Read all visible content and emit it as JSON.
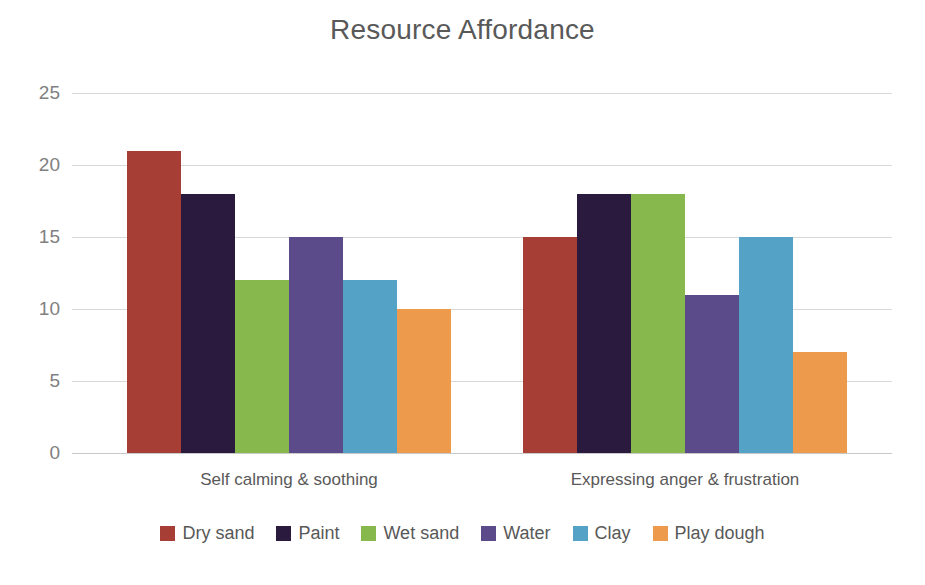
{
  "chart_data": {
    "type": "bar",
    "title": "Resource Affordance",
    "xlabel": "",
    "ylabel": "",
    "ylim": [
      0,
      25
    ],
    "yticks": [
      0,
      5,
      10,
      15,
      20,
      25
    ],
    "grid": true,
    "legend_position": "bottom",
    "categories": [
      "Self calming & soothing",
      "Expressing anger & frustration"
    ],
    "series": [
      {
        "name": "Dry sand",
        "color": "#A63E35",
        "values": [
          21,
          15
        ]
      },
      {
        "name": "Paint",
        "color": "#2A1A3E",
        "values": [
          18,
          18
        ]
      },
      {
        "name": "Wet sand",
        "color": "#86B84E",
        "values": [
          12,
          18
        ]
      },
      {
        "name": "Water",
        "color": "#5B4B8A",
        "values": [
          15,
          11
        ]
      },
      {
        "name": "Clay",
        "color": "#54A3C6",
        "values": [
          12,
          15
        ]
      },
      {
        "name": "Play dough",
        "color": "#EE9A4D",
        "values": [
          10,
          7
        ]
      }
    ]
  }
}
